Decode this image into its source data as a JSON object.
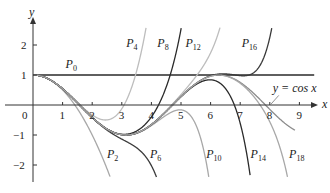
{
  "chart_data": {
    "type": "line",
    "title": "",
    "xlabel": "x",
    "ylabel": "y",
    "xlim": [
      0,
      9.5
    ],
    "ylim": [
      -2.4,
      2.6
    ],
    "x_ticks": [
      "0",
      "1",
      "2",
      "3",
      "4",
      "5",
      "6",
      "7",
      "8",
      "9"
    ],
    "y_ticks": [
      "2",
      "1",
      "-1",
      "-2"
    ],
    "grid": false,
    "series": [
      {
        "name": "P0",
        "label": "P",
        "sub": "0",
        "degree": 0,
        "color": "#2a2a2a",
        "label_pos": [
          1.1,
          1.25
        ]
      },
      {
        "name": "P2",
        "label": "P",
        "sub": "2",
        "degree": 2,
        "color": "#a8a8a8",
        "label_pos": [
          2.5,
          -1.75
        ]
      },
      {
        "name": "P4",
        "label": "P",
        "sub": "4",
        "degree": 4,
        "color": "#bdbdbd",
        "label_pos": [
          3.15,
          1.95
        ]
      },
      {
        "name": "P6",
        "label": "P",
        "sub": "6",
        "degree": 6,
        "color": "#3a3a3a",
        "label_pos": [
          3.95,
          -1.75
        ]
      },
      {
        "name": "P8",
        "label": "P",
        "sub": "8",
        "degree": 8,
        "color": "#2a2a2a",
        "label_pos": [
          4.2,
          1.95
        ]
      },
      {
        "name": "P10",
        "label": "P",
        "sub": "10",
        "degree": 10,
        "color": "#a8a8a8",
        "label_pos": [
          5.85,
          -1.75
        ]
      },
      {
        "name": "P12",
        "label": "P",
        "sub": "12",
        "degree": 12,
        "color": "#bdbdbd",
        "label_pos": [
          5.15,
          1.95
        ]
      },
      {
        "name": "P14",
        "label": "P",
        "sub": "14",
        "degree": 14,
        "color": "#2a2a2a",
        "label_pos": [
          7.35,
          -1.75
        ]
      },
      {
        "name": "P16",
        "label": "P",
        "sub": "16",
        "degree": 16,
        "color": "#3a3a3a",
        "label_pos": [
          7.05,
          1.95
        ]
      },
      {
        "name": "P18",
        "label": "P",
        "sub": "18",
        "degree": 18,
        "color": "#a8a8a8",
        "label_pos": [
          8.65,
          -1.75
        ]
      },
      {
        "name": "cos x",
        "label": "y = cos x",
        "degree": -1,
        "color": "#8c8c8c",
        "label_pos": [
          8.1,
          0.42
        ]
      }
    ]
  }
}
